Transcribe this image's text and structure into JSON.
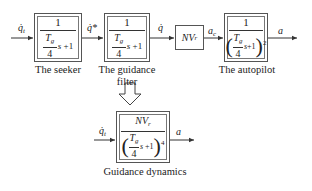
{
  "diagram": {
    "blocks": [
      {
        "id": "seeker",
        "numerator": "1",
        "denominator": "Tg/4 s + 1",
        "tg_top": "T",
        "tg_sub": "g",
        "tg_bottom": "4",
        "tail": "s + 1",
        "label": "The seeker"
      },
      {
        "id": "guidance-filter",
        "numerator": "1",
        "denominator": "Tg/4 s + 1",
        "tg_top": "T",
        "tg_sub": "g",
        "tg_bottom": "4",
        "tail": "s + 1",
        "label_line1": "The guidance",
        "label_line2": "filter"
      },
      {
        "id": "gain",
        "text": "NV",
        "sub": "r"
      },
      {
        "id": "autopilot",
        "numerator": "1",
        "denominator": "(Tg/4 s + 1)^2",
        "tg_top": "T",
        "tg_sub": "g",
        "tg_bottom": "4",
        "tail": "s + 1",
        "power": "2",
        "label": "The autopilot"
      },
      {
        "id": "guidance-dynamics",
        "numerator": "NV",
        "numerator_sub": "r",
        "denominator": "(Tg/4 s + 1)^4",
        "tg_top": "T",
        "tg_sub": "g",
        "tg_bottom": "4",
        "tail": "s + 1",
        "power": "4",
        "label": "Guidance dynamics"
      }
    ],
    "signals": {
      "input": {
        "text": "q̇",
        "sub": "t"
      },
      "seeker_out": {
        "text": "q̇*"
      },
      "filter_out": {
        "text": "q̇"
      },
      "gain_out": {
        "text": "a",
        "sub": "c"
      },
      "output": {
        "text": "a"
      },
      "dyn_input": {
        "text": "q̇",
        "sub": "t"
      },
      "dyn_output": {
        "text": "a"
      }
    }
  }
}
